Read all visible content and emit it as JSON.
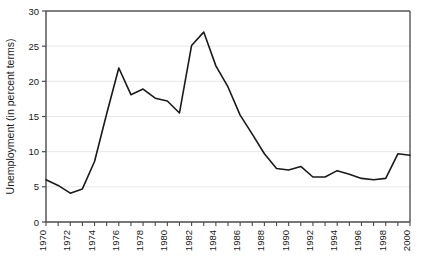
{
  "chart_data": {
    "type": "line",
    "title": "",
    "xlabel": "",
    "ylabel": "Unemployment (in percent terms)",
    "ylim": [
      0,
      30
    ],
    "xlim": [
      1970,
      2000
    ],
    "yticks": [
      0,
      5,
      10,
      15,
      20,
      25,
      30
    ],
    "ytick_labels": [
      "0",
      "5",
      "10",
      "15",
      "20",
      "25",
      "30"
    ],
    "xticks": [
      1970,
      1971,
      1972,
      1973,
      1974,
      1975,
      1976,
      1977,
      1978,
      1979,
      1980,
      1981,
      1982,
      1983,
      1984,
      1985,
      1986,
      1987,
      1988,
      1989,
      1990,
      1991,
      1992,
      1993,
      1994,
      1995,
      1996,
      1997,
      1998,
      1999,
      2000
    ],
    "xtick_labels": [
      "1970",
      "1972",
      "1974",
      "1976",
      "1978",
      "1980",
      "1982",
      "1984",
      "1986",
      "1988",
      "1990",
      "1992",
      "1994",
      "1996",
      "1998",
      "2000"
    ],
    "xtick_label_years": [
      1970,
      1972,
      1974,
      1976,
      1978,
      1980,
      1982,
      1984,
      1986,
      1988,
      1990,
      1992,
      1994,
      1996,
      1998,
      2000
    ],
    "xtick_label_rotation": -90,
    "grid": "horizontal",
    "grid_color": "#e8e8e8",
    "legend": "none",
    "line_color": "#1a1a1a",
    "line_width": 1.6,
    "x": [
      1970,
      1971,
      1972,
      1973,
      1974,
      1975,
      1976,
      1977,
      1978,
      1979,
      1980,
      1981,
      1982,
      1983,
      1984,
      1985,
      1986,
      1987,
      1988,
      1989,
      1990,
      1991,
      1992,
      1993,
      1994,
      1995,
      1996,
      1997,
      1998,
      1999,
      2000
    ],
    "values": [
      6.0,
      5.2,
      4.1,
      4.7,
      8.6,
      15.4,
      21.9,
      18.1,
      18.9,
      17.6,
      17.2,
      15.5,
      25.1,
      27.0,
      22.2,
      19.2,
      15.2,
      12.5,
      9.7,
      7.6,
      7.4,
      7.9,
      6.4,
      6.4,
      7.3,
      6.8,
      6.2,
      6.0,
      6.2,
      9.7,
      9.5
    ],
    "series": [
      {
        "name": "Unemployment",
        "values": [
          6.0,
          5.2,
          4.1,
          4.7,
          8.6,
          15.4,
          21.9,
          18.1,
          18.9,
          17.6,
          17.2,
          15.5,
          25.1,
          27.0,
          22.2,
          19.2,
          15.2,
          12.5,
          9.7,
          7.6,
          7.4,
          7.9,
          6.4,
          6.4,
          7.3,
          6.8,
          6.2,
          6.0,
          6.2,
          9.7,
          9.5
        ]
      }
    ]
  },
  "axes": {
    "plot_left": 46,
    "plot_right": 410,
    "plot_top": 11,
    "plot_bottom": 222,
    "frame_color": "#555555"
  }
}
